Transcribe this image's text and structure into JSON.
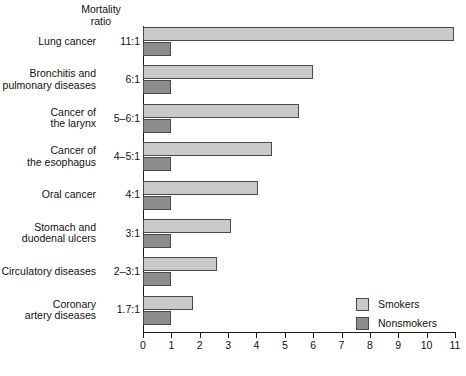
{
  "chart_data": {
    "type": "bar",
    "orientation": "horizontal",
    "title": "",
    "header_label": "Mortality\nratio",
    "header_line1": "Mortality",
    "header_line2": "ratio",
    "xlabel": "",
    "ylabel": "",
    "xlim": [
      0,
      11
    ],
    "xticks": [
      0,
      1,
      2,
      3,
      4,
      5,
      6,
      7,
      8,
      9,
      10,
      11
    ],
    "xtick_labels": [
      "0",
      "1",
      "2",
      "3",
      "4",
      "5",
      "6",
      "7",
      "8",
      "9",
      "10",
      "11"
    ],
    "grid": false,
    "legend_position": "bottom-right",
    "categories": [
      "Lung cancer",
      "Bronchitis and pulmonary diseases",
      "Cancer of the larynx",
      "Cancer of the esophagus",
      "Oral cancer",
      "Stomach and duodenal ulcers",
      "Circulatory diseases",
      "Coronary artery diseases"
    ],
    "category_lines": [
      [
        "Lung cancer"
      ],
      [
        "Bronchitis and",
        "pulmonary diseases"
      ],
      [
        "Cancer of",
        "the larynx"
      ],
      [
        "Cancer of",
        "the esophagus"
      ],
      [
        "Oral cancer"
      ],
      [
        "Stomach and",
        "duodenal ulcers"
      ],
      [
        "Circulatory diseases"
      ],
      [
        "Coronary",
        "artery diseases"
      ]
    ],
    "mortality_ratios": [
      "11:1",
      "6:1",
      "5–6:1",
      "4–5:1",
      "4:1",
      "3:1",
      "2–3:1",
      "1.7:1"
    ],
    "series": [
      {
        "name": "Smokers",
        "color": "#c9c9c9",
        "values": [
          10.95,
          6.0,
          5.5,
          4.55,
          4.05,
          3.1,
          2.6,
          1.75
        ]
      },
      {
        "name": "Nonsmokers",
        "color": "#8c8c8c",
        "values": [
          1.0,
          1.0,
          1.0,
          1.0,
          1.0,
          1.0,
          1.0,
          1.0
        ]
      }
    ],
    "legend": [
      {
        "label": "Smokers",
        "color": "#c9c9c9"
      },
      {
        "label": "Nonsmokers",
        "color": "#8c8c8c"
      }
    ]
  },
  "colors": {
    "smokers": "#c9c9c9",
    "nonsmokers": "#8c8c8c",
    "axis": "#1a1a1a",
    "bar_border": "#4a4a4a",
    "background": "#ffffff"
  }
}
